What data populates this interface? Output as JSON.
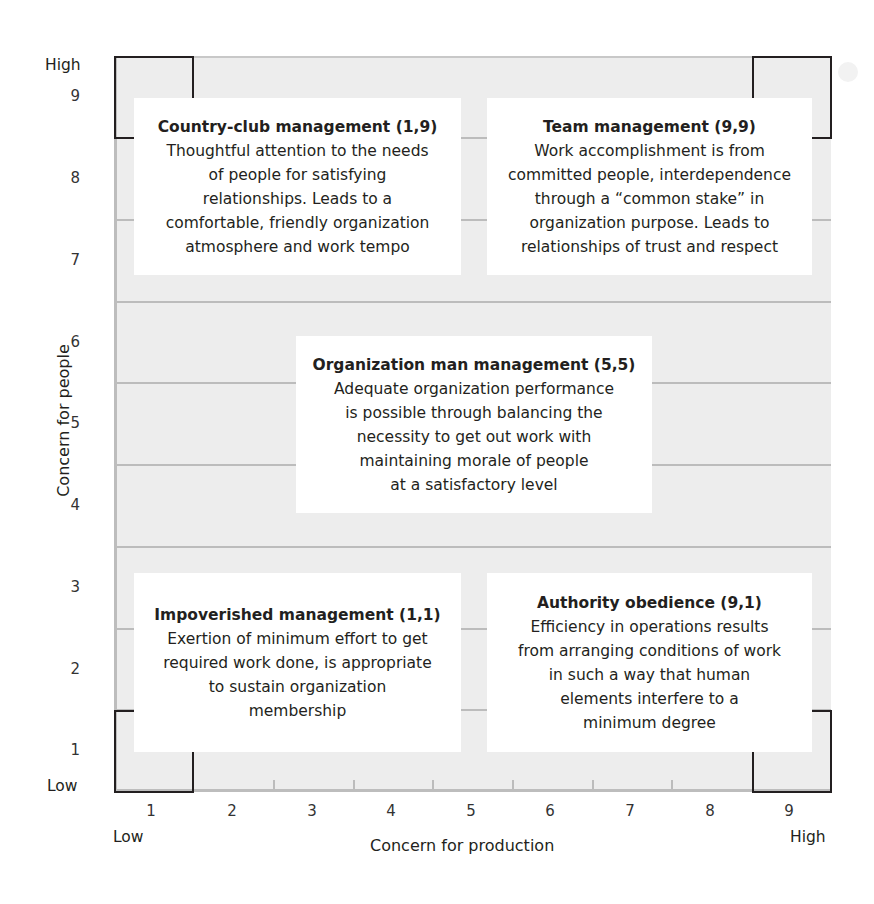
{
  "diagram": {
    "type": "managerial-grid",
    "x_axis": {
      "title": "Concern for production",
      "low_label": "Low",
      "high_label": "High",
      "ticks": [
        "1",
        "2",
        "3",
        "4",
        "5",
        "6",
        "7",
        "8",
        "9"
      ]
    },
    "y_axis": {
      "title": "Concern for people",
      "low_label": "Low",
      "high_label": "High",
      "ticks": [
        "9",
        "8",
        "7",
        "6",
        "5",
        "4",
        "3",
        "2",
        "1"
      ]
    },
    "styles": [
      {
        "id": "country-club",
        "title": "Country-club management (1,9)",
        "description": "Thoughtful attention to the needs\nof people for satisfying\nrelationships. Leads to a\ncomfortable, friendly organization\natmosphere and work tempo",
        "position": [
          1,
          9
        ]
      },
      {
        "id": "team",
        "title": "Team management (9,9)",
        "description": "Work accomplishment is from\ncommitted people, interdependence\nthrough a “common stake” in\norganization purpose. Leads to\nrelationships of trust and respect",
        "position": [
          9,
          9
        ]
      },
      {
        "id": "organization-man",
        "title": "Organization man management (5,5)",
        "description": "Adequate organization performance\nis possible through balancing the\nnecessity to get out work with\nmaintaining morale of people\nat a satisfactory level",
        "position": [
          5,
          5
        ]
      },
      {
        "id": "impoverished",
        "title": "Impoverished management (1,1)",
        "description": "Exertion of minimum effort to get\nrequired work done, is appropriate\nto sustain organization\nmembership",
        "position": [
          1,
          1
        ]
      },
      {
        "id": "authority-obedience",
        "title": "Authority obedience (9,1)",
        "description": "Efficiency in operations results\nfrom arranging conditions of work\nin such a way that human\nelements interfere to a\nminimum degree",
        "position": [
          9,
          1
        ]
      }
    ],
    "colors": {
      "plot_background": "#ededed",
      "gridline": "#bcbcbc",
      "box_background": "#ffffff",
      "corner_outline": "#231f20",
      "text": "#231f20"
    }
  }
}
